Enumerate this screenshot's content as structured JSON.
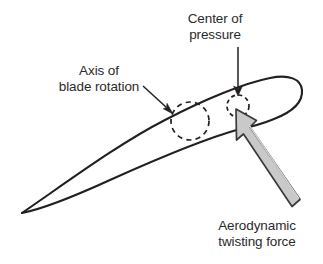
{
  "diagram": {
    "background_color": "#ffffff",
    "line_color": "#231f20",
    "text_color": "#2b2b2b",
    "arrow_fill_color": "#c9c9c9",
    "arrow_outline_color": "#3a3a3a"
  },
  "labels": {
    "center_of_pressure": {
      "line1": "Center of",
      "line2": "pressure"
    },
    "axis_of_blade_rotation": {
      "line1": "Axis of",
      "line2": "blade rotation"
    },
    "aerodynamic_twisting_force": {
      "line1": "Aerodynamic",
      "line2": "twisting force"
    }
  },
  "features": {
    "airfoil_outline": {
      "name": "airfoil-cross-section",
      "leading_edge": "right (rounded nose)",
      "trailing_edge": "left (sharp tip)",
      "tip_point": [
        22,
        213
      ],
      "nose_extent_x": 300
    },
    "axis_of_blade_rotation_circle": {
      "style": "dashed",
      "center": [
        190,
        121
      ],
      "radius": 19
    },
    "center_of_pressure_circle": {
      "style": "dashed",
      "center": [
        238,
        106
      ],
      "radius": 11
    },
    "center_of_pressure_leader": {
      "style": "thin-arrow",
      "from": [
        238,
        48
      ],
      "to": [
        238,
        95
      ],
      "direction": "down"
    },
    "axis_of_blade_rotation_leader": {
      "style": "thin-arrow",
      "from": [
        145,
        88
      ],
      "to": [
        172,
        114
      ],
      "direction": "down-right"
    },
    "aerodynamic_force_arrow": {
      "style": "thick-block-arrow",
      "tip": [
        236,
        109
      ],
      "tail": [
        301,
        206
      ],
      "direction": "up-left"
    }
  }
}
